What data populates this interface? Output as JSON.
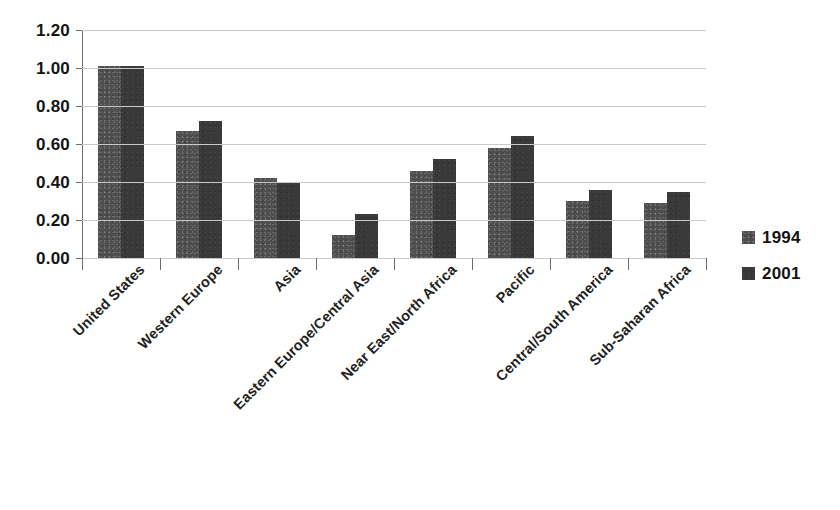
{
  "chart_data": {
    "type": "bar",
    "title": "",
    "subtitle": "",
    "xlabel": "",
    "ylabel": "",
    "ylim": [
      0.0,
      1.2
    ],
    "ytick_labels": [
      "1.20",
      "1.00",
      "0.80",
      "0.60",
      "0.40",
      "0.20",
      "0.00"
    ],
    "ytick_values": [
      1.2,
      1.0,
      0.8,
      0.6,
      0.4,
      0.2,
      0.0
    ],
    "grid": true,
    "legend_position": "right",
    "categories": [
      "United States",
      "Western Europe",
      "Asia",
      "Eastern Europe/Central Asia",
      "Near East/North Africa",
      "Pacific",
      "Central/South America",
      "Sub-Saharan Africa"
    ],
    "series": [
      {
        "name": "1994",
        "color": "#4e4e4e",
        "values": [
          1.01,
          0.67,
          0.42,
          0.12,
          0.46,
          0.58,
          0.3,
          0.29
        ]
      },
      {
        "name": "2001",
        "color": "#393939",
        "values": [
          1.01,
          0.72,
          0.4,
          0.23,
          0.52,
          0.64,
          0.36,
          0.35
        ]
      }
    ]
  },
  "legend": {
    "items": [
      {
        "label": "1994",
        "swatch": "legend-swatch-1994"
      },
      {
        "label": "2001",
        "swatch": "legend-swatch-2001"
      }
    ]
  },
  "colors": {
    "series_1994": "#4e4e4e",
    "series_2001": "#393939",
    "gridline": "#c9c9c9",
    "axis": "#6e6e6e",
    "text": "#141414",
    "background": "#ffffff"
  }
}
